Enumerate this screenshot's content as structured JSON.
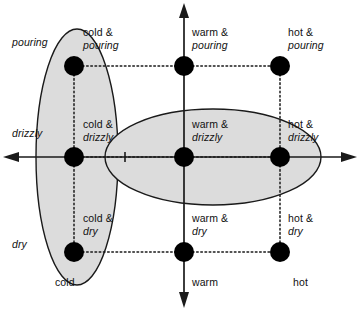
{
  "diagram": {
    "axes": {
      "vertical": {
        "name": "precipitation-axis",
        "top_arrow": true,
        "bottom_arrow": true
      },
      "horizontal": {
        "name": "temperature-axis",
        "left_arrow": true,
        "right_arrow": true
      },
      "tick_label": ""
    },
    "rows": [
      {
        "key": "pouring",
        "label": "pouring",
        "y": 66
      },
      {
        "key": "drizzly",
        "label": "drizzly",
        "y": 157
      },
      {
        "key": "dry",
        "label": "dry",
        "y": 252
      }
    ],
    "columns": [
      {
        "key": "cold",
        "label": "cold",
        "x": 74
      },
      {
        "key": "warm",
        "label": "warm",
        "x": 184
      },
      {
        "key": "hot",
        "label": "hot",
        "x": 280
      }
    ],
    "nodes": [
      {
        "name": "node-cold-pouring",
        "first": "cold &",
        "second": "pouring",
        "x": 74,
        "y": 66
      },
      {
        "name": "node-warm-pouring",
        "first": "warm &",
        "second": "pouring",
        "x": 184,
        "y": 66
      },
      {
        "name": "node-hot-pouring",
        "first": "hot &",
        "second": "pouring",
        "x": 280,
        "y": 66
      },
      {
        "name": "node-cold-drizzly",
        "first": "cold &",
        "second": "drizzly",
        "x": 74,
        "y": 157
      },
      {
        "name": "node-warm-drizzly",
        "first": "warm &",
        "second": "drizzly",
        "x": 184,
        "y": 157
      },
      {
        "name": "node-hot-drizzly",
        "first": "hot &",
        "second": "drizzly",
        "x": 280,
        "y": 157
      },
      {
        "name": "node-cold-dry",
        "first": "cold &",
        "second": "dry",
        "x": 74,
        "y": 252
      },
      {
        "name": "node-warm-dry",
        "first": "warm &",
        "second": "dry",
        "x": 184,
        "y": 252
      },
      {
        "name": "node-hot-dry",
        "first": "hot &",
        "second": "dry",
        "x": 280,
        "y": 252
      }
    ],
    "labels": {
      "node_cold_pouring_1": "cold &",
      "node_cold_pouring_2": "pouring",
      "node_warm_pouring_1": "warm &",
      "node_warm_pouring_2": "pouring",
      "node_hot_pouring_1": "hot &",
      "node_hot_pouring_2": "pouring",
      "node_cold_drizzly_1": "cold &",
      "node_cold_drizzly_2": "drizzly",
      "node_warm_drizzly_1": "warm &",
      "node_warm_drizzly_2": "drizzly",
      "node_hot_drizzly_1": "hot &",
      "node_hot_drizzly_2": "drizzly",
      "node_cold_dry_1": "cold &",
      "node_cold_dry_2": "dry",
      "node_warm_dry_1": "warm &",
      "node_warm_dry_2": "dry",
      "node_hot_dry_1": "hot &",
      "node_hot_dry_2": "dry",
      "axis_pouring": "pouring",
      "axis_drizzly": "drizzly",
      "axis_dry": "dry",
      "axis_cold": "cold",
      "axis_warm": "warm",
      "axis_hot": "hot"
    },
    "regions": [
      {
        "name": "cold-region-blob",
        "orientation": "vertical",
        "cx": 77,
        "cy": 157,
        "rx": 41,
        "ry": 128
      },
      {
        "name": "drizzly-region-blob",
        "orientation": "horizontal",
        "cx": 213,
        "cy": 157,
        "rx": 108,
        "ry": 48
      }
    ],
    "colors": {
      "region_fill": "#dcdcdc",
      "stroke": "#1a1a1a",
      "node_fill": "#000000",
      "background": "#ffffff"
    }
  }
}
